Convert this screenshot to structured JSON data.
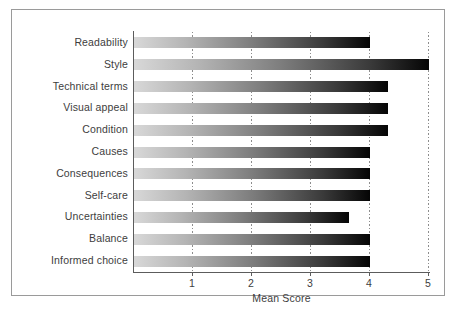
{
  "figure": {
    "frame_color": "#9a9a9a",
    "background": "#ffffff",
    "axis_color": "#5c5c5c",
    "text_color": "#3d3d3d",
    "gridline_color": "#8d8d8d",
    "bar_gradient_start": "#d8d8d8",
    "bar_gradient_end": "#050505"
  },
  "chart_data": {
    "type": "bar",
    "orientation": "horizontal",
    "title": "",
    "xlabel": "Mean Score",
    "ylabel": "",
    "xlim": [
      0,
      5
    ],
    "ylim": null,
    "xticks": [
      1,
      2,
      3,
      4,
      5
    ],
    "xtick_labels": [
      "1",
      "2",
      "3",
      "4",
      "5"
    ],
    "grid": true,
    "grid_axis": "x",
    "grid_style": "dotted",
    "legend": null,
    "categories": [
      "Readability",
      "Style",
      "Technical terms",
      "Visual appeal",
      "Condition",
      "Causes",
      "Consequences",
      "Self-care",
      "Uncertainties",
      "Balance",
      "Informed choice"
    ],
    "values": [
      4.0,
      5.0,
      4.3,
      4.3,
      4.3,
      4.0,
      4.0,
      4.0,
      3.65,
      4.0,
      4.0
    ],
    "series": [
      {
        "name": "Mean Score",
        "values": [
          4.0,
          5.0,
          4.3,
          4.3,
          4.3,
          4.0,
          4.0,
          4.0,
          3.65,
          4.0,
          4.0
        ]
      }
    ]
  }
}
